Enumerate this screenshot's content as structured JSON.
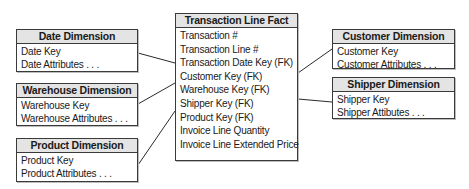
{
  "diagram": {
    "type": "star-schema",
    "fact": {
      "title": "Transaction Line Fact",
      "fields": [
        "Transaction #",
        "Transaction Line #",
        "Transaction Date Key (FK)",
        "Customer Key (FK)",
        "Warehouse Key (FK)",
        "Shipper Key (FK)",
        "Product Key (FK)",
        "Invoice Line Quantity",
        "Invoice Line Extended Price"
      ]
    },
    "dimensions": {
      "date": {
        "title": "Date Dimension",
        "fields": [
          "Date Key",
          "Date Attributes . . ."
        ]
      },
      "warehouse": {
        "title": "Warehouse Dimension",
        "fields": [
          "Warehouse Key",
          "Warehouse Attributes . . ."
        ]
      },
      "product": {
        "title": "Product Dimension",
        "fields": [
          "Product Key",
          "Product Attributes . . ."
        ]
      },
      "customer": {
        "title": "Customer Dimension",
        "fields": [
          "Customer Key",
          "Customer Attributes . . ."
        ]
      },
      "shipper": {
        "title": "Shipper Dimension",
        "fields": [
          "Shipper Key",
          "Shipper Attibutes . . ."
        ]
      }
    },
    "relationships": [
      {
        "from": "Date Dimension",
        "to": "Transaction Date Key (FK)"
      },
      {
        "from": "Warehouse Dimension",
        "to": "Customer Key (FK)"
      },
      {
        "from": "Product Dimension",
        "to": "Product Key (FK)"
      },
      {
        "from": "Customer Dimension",
        "to": "Transaction Line Fact"
      },
      {
        "from": "Shipper Dimension",
        "to": "Transaction Line Fact"
      }
    ],
    "colors": {
      "header_bg": "#e4e4e4",
      "border": "#3a3a3a",
      "line": "#2a2a2a"
    }
  }
}
